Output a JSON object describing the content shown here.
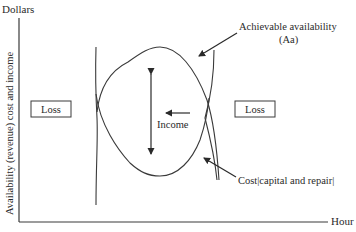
{
  "diagram": {
    "y_axis_top_label": "Dollars",
    "y_axis_label": "Availability (revenue) cost and income",
    "x_axis_label": "Hour",
    "boxes": [
      {
        "label": "Loss",
        "position": "left"
      },
      {
        "label": "Loss",
        "position": "right"
      }
    ],
    "annotations": {
      "achievable_availability_line1": "Achievable availability",
      "achievable_availability_line2": "(Aa)",
      "income": "Income",
      "cost": "Cost|capital and repair|"
    },
    "colors": {
      "stroke": "#3a3a3a",
      "text": "#2a2a2a",
      "background": "#ffffff"
    }
  }
}
